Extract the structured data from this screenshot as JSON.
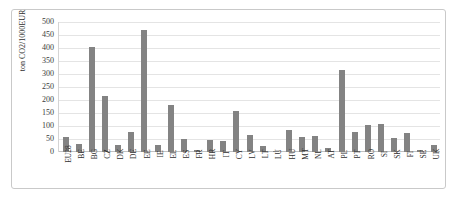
{
  "chart_data": {
    "type": "bar",
    "title": "",
    "xlabel": "",
    "ylabel": "ton CO2/1000EUR",
    "ylim": [
      0,
      500
    ],
    "yticks": [
      0,
      50,
      100,
      150,
      200,
      250,
      300,
      350,
      400,
      450,
      500
    ],
    "grid": true,
    "legend": false,
    "bar_color": "#838383",
    "categories": [
      "EU28",
      "BE",
      "BG",
      "CZ",
      "DK",
      "DE",
      "EE",
      "IE",
      "EL",
      "ES",
      "FR",
      "HR",
      "IT",
      "CY",
      "LV",
      "LT",
      "LU",
      "HU",
      "MT",
      "NL",
      "AT",
      "PL",
      "PT",
      "RO",
      "SI",
      "SK",
      "FI",
      "SE",
      "UK"
    ],
    "values": [
      58,
      30,
      405,
      215,
      28,
      78,
      470,
      28,
      180,
      50,
      6,
      46,
      41,
      159,
      65,
      24,
      3,
      85,
      56,
      63,
      16,
      316,
      78,
      103,
      108,
      54,
      73,
      8,
      26
    ]
  }
}
